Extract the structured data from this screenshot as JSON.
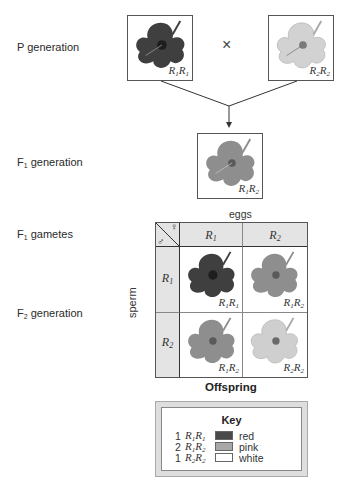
{
  "rows": {
    "p_generation": "P generation",
    "f1_generation": {
      "prefix": "F",
      "sub": "1",
      "suffix": " generation"
    },
    "f1_gametes": {
      "prefix": "F",
      "sub": "1",
      "suffix": " gametes"
    },
    "f2_generation": {
      "prefix": "F",
      "sub": "2",
      "suffix": " generation"
    }
  },
  "parents": [
    {
      "genotype": {
        "a": "R",
        "a_sub": "1",
        "b": "R",
        "b_sub": "1"
      },
      "color": "red"
    },
    {
      "genotype": {
        "a": "R",
        "a_sub": "2",
        "b": "R",
        "b_sub": "2"
      },
      "color": "white"
    }
  ],
  "cross_symbol": "×",
  "f1": {
    "genotype": {
      "a": "R",
      "a_sub": "1",
      "b": "R",
      "b_sub": "2"
    },
    "color": "pink"
  },
  "punnett": {
    "eggs_label": "eggs",
    "sperm_label": "sperm",
    "corner_symbols": {
      "female": "♀",
      "male": "♂"
    },
    "columns": [
      {
        "a": "R",
        "sub": "1"
      },
      {
        "a": "R",
        "sub": "2"
      }
    ],
    "rows": [
      {
        "a": "R",
        "sub": "1"
      },
      {
        "a": "R",
        "sub": "2"
      }
    ],
    "cells": [
      [
        {
          "a": "R",
          "a_sub": "1",
          "b": "R",
          "b_sub": "1",
          "color": "red"
        },
        {
          "a": "R",
          "a_sub": "1",
          "b": "R",
          "b_sub": "2",
          "color": "pink"
        }
      ],
      [
        {
          "a": "R",
          "a_sub": "1",
          "b": "R",
          "b_sub": "2",
          "color": "pink"
        },
        {
          "a": "R",
          "a_sub": "2",
          "b": "R",
          "b_sub": "2",
          "color": "white"
        }
      ]
    ],
    "caption": "Offspring"
  },
  "key": {
    "title": "Key",
    "items": [
      {
        "count": "1",
        "a": "R",
        "a_sub": "1",
        "b": "R",
        "b_sub": "1",
        "label": "red",
        "swatch": "#4a4a4a"
      },
      {
        "count": "2",
        "a": "R",
        "a_sub": "1",
        "b": "R",
        "b_sub": "2",
        "label": "pink",
        "swatch": "#a8a8a8"
      },
      {
        "count": "1",
        "a": "R",
        "a_sub": "2",
        "b": "R",
        "b_sub": "2",
        "label": "white",
        "swatch": "#ffffff"
      }
    ]
  },
  "colors": {
    "red": {
      "petal": "#3f3f3f",
      "dark": "#1e1e1e"
    },
    "pink": {
      "petal": "#8e8e8e",
      "dark": "#5a5a5a"
    },
    "white": {
      "petal": "#cfcfcf",
      "dark": "#8a8a8a"
    }
  }
}
